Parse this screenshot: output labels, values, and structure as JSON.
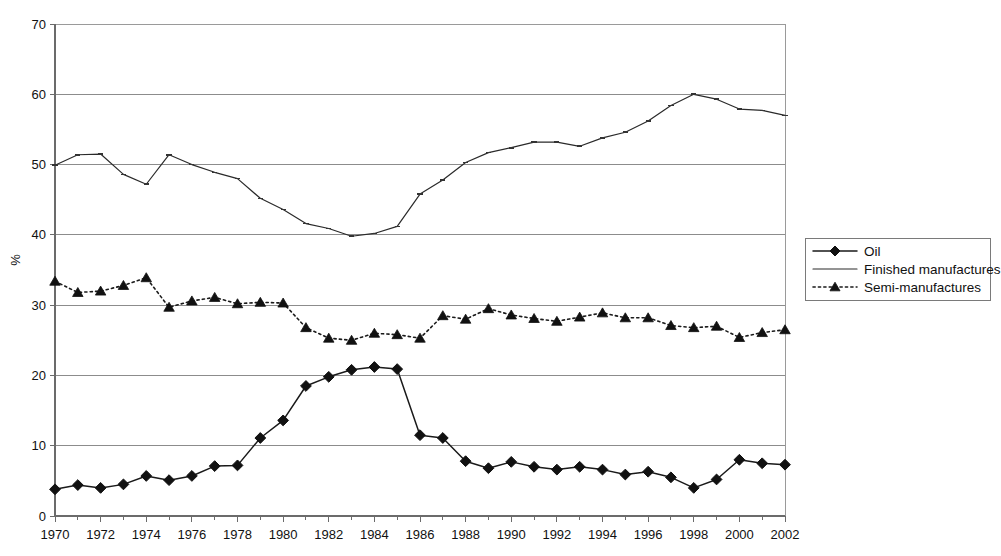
{
  "chart_data": {
    "type": "line",
    "title": "",
    "subtitle": "",
    "xlabel": "",
    "ylabel": "%",
    "xlim": [
      1970,
      2002
    ],
    "ylim": [
      0,
      70
    ],
    "y_ticks": [
      0,
      10,
      20,
      30,
      40,
      50,
      60,
      70
    ],
    "x_ticks_major": [
      1970,
      1972,
      1974,
      1976,
      1978,
      1980,
      1982,
      1984,
      1986,
      1988,
      1990,
      1992,
      1994,
      1996,
      1998,
      2000,
      2002
    ],
    "x_tick_interval_minor": 1,
    "grid": "horizontal",
    "legend_position": "right",
    "x": [
      1970,
      1971,
      1972,
      1973,
      1974,
      1975,
      1976,
      1977,
      1978,
      1979,
      1980,
      1981,
      1982,
      1983,
      1984,
      1985,
      1986,
      1987,
      1988,
      1989,
      1990,
      1991,
      1992,
      1993,
      1994,
      1995,
      1996,
      1997,
      1998,
      1999,
      2000,
      2001,
      2002
    ],
    "series": [
      {
        "name": "Oil",
        "marker": "diamond",
        "line_style": "solid",
        "color": "#111111",
        "values": [
          3.8,
          4.4,
          4.0,
          4.5,
          5.7,
          5.1,
          5.7,
          7.1,
          7.2,
          11.1,
          13.6,
          18.5,
          19.8,
          20.8,
          21.2,
          20.9,
          11.5,
          11.1,
          7.8,
          6.8,
          7.7,
          7.0,
          6.6,
          7.0,
          6.6,
          5.9,
          6.3,
          5.5,
          4.0,
          5.2,
          8.0,
          7.5,
          7.3
        ]
      },
      {
        "name": "Finished manufactures",
        "marker": "none",
        "line_style": "solid",
        "color": "#222222",
        "values": [
          49.9,
          51.4,
          51.5,
          48.6,
          47.2,
          51.4,
          50.0,
          48.9,
          48.0,
          45.2,
          43.6,
          41.6,
          40.9,
          39.8,
          40.2,
          41.2,
          45.8,
          47.8,
          50.3,
          51.7,
          52.4,
          53.2,
          53.2,
          52.6,
          53.8,
          54.6,
          56.2,
          58.4,
          60.0,
          59.3,
          57.9,
          57.7,
          57.0
        ]
      },
      {
        "name": "Semi-manufactures",
        "marker": "triangle",
        "line_style": "dotted",
        "color": "#111111",
        "values": [
          33.4,
          31.8,
          32.0,
          32.8,
          33.9,
          29.7,
          30.6,
          31.1,
          30.2,
          30.4,
          30.3,
          26.8,
          25.3,
          25.0,
          26.0,
          25.8,
          25.3,
          28.5,
          28.0,
          29.5,
          28.6,
          28.1,
          27.7,
          28.3,
          28.9,
          28.2,
          28.2,
          27.1,
          26.8,
          27.0,
          25.4,
          26.1,
          26.5
        ]
      }
    ],
    "legend_entries": [
      {
        "label": "Oil",
        "marker": "diamond",
        "line_style": "solid"
      },
      {
        "label": "Finished manufactures",
        "marker": "none",
        "line_style": "solid"
      },
      {
        "label": "Semi-manufactures",
        "marker": "triangle",
        "line_style": "dotted"
      }
    ]
  }
}
